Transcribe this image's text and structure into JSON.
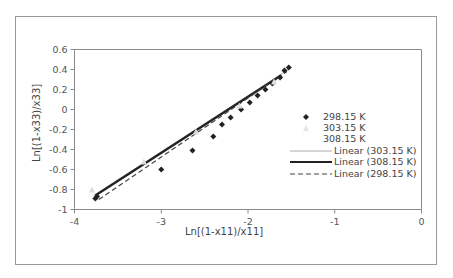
{
  "chart_data": {
    "type": "scatter",
    "title": "",
    "xlabel": "Ln[(1-x11)/x11]",
    "ylabel": "Ln[(1-x33)/x33]",
    "xlim": [
      -4,
      0
    ],
    "ylim": [
      -1,
      0.6
    ],
    "x_ticks": [
      -4,
      -3,
      -2,
      -1,
      0
    ],
    "y_ticks": [
      0.6,
      0.4,
      0.2,
      0,
      -0.2,
      -0.4,
      -0.6,
      -0.8,
      -1
    ],
    "x_tick_labels": [
      "-4",
      "-3",
      "-2",
      "-1",
      "0"
    ],
    "y_tick_labels": [
      "0.6",
      "0.4",
      "0.2",
      "0",
      "-0.2",
      "-0.4",
      "-0.6",
      "-0.8",
      "-1"
    ],
    "grid": false,
    "legend_position": "right",
    "series": [
      {
        "name": "298.15 K",
        "marker": "diamond",
        "color": "#222222",
        "x": [
          -3.76,
          -3.74,
          -3.0,
          -2.64,
          -2.4,
          -2.3,
          -2.2,
          -2.08,
          -1.98,
          -1.89,
          -1.8,
          -1.72,
          -1.63,
          -1.58,
          -1.53
        ],
        "y": [
          -0.89,
          -0.87,
          -0.6,
          -0.41,
          -0.27,
          -0.15,
          -0.08,
          0.0,
          0.07,
          0.14,
          0.2,
          0.26,
          0.32,
          0.39,
          0.42
        ]
      },
      {
        "name": "303.15 K",
        "marker": "triangle",
        "color": "#dddddd",
        "x": [
          -3.8,
          -3.2,
          -2.6,
          -2.1,
          -1.7
        ],
        "y": [
          -0.8,
          -0.52,
          -0.22,
          0.04,
          0.28
        ]
      },
      {
        "name": "308.15 K",
        "marker": "none",
        "color": "#ffffff",
        "x": [],
        "y": []
      }
    ],
    "trendlines": [
      {
        "name": "Linear (303.15 K)",
        "style": "thin",
        "color": "#999999",
        "x": [
          -3.78,
          -1.5
        ],
        "y": [
          -0.86,
          0.42
        ]
      },
      {
        "name": "Linear (308.15 K)",
        "style": "thick",
        "color": "#222222",
        "x": [
          -3.76,
          -1.62
        ],
        "y": [
          -0.86,
          0.34
        ]
      },
      {
        "name": "Linear (298.15 K)",
        "style": "dashed",
        "color": "#444444",
        "x": [
          -3.72,
          -1.55
        ],
        "y": [
          -0.9,
          0.38
        ]
      }
    ]
  },
  "legend": {
    "items": [
      {
        "label": "298.15 K",
        "kind": "marker-diamond"
      },
      {
        "label": "303.15 K",
        "kind": "marker-light"
      },
      {
        "label": "308.15 K",
        "kind": "marker-none"
      },
      {
        "label": "Linear (303.15 K)",
        "kind": "line-thin"
      },
      {
        "label": "Linear (308.15 K)",
        "kind": "line-thick"
      },
      {
        "label": "Linear (298.15 K)",
        "kind": "line-dashed"
      }
    ]
  }
}
